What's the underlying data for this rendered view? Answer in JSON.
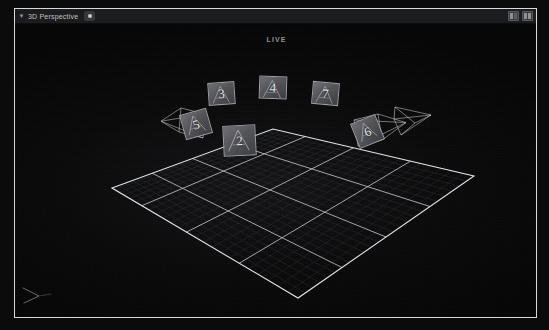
{
  "window": {
    "title": "3D Perspective",
    "caret_icon": "chevron-down-icon",
    "camera_badge_icon": "camera-icon",
    "toolbar_icons": [
      "panel-layout-icon",
      "split-layout-icon"
    ]
  },
  "scene": {
    "live_label": "LIVE",
    "axis_gizmo_icon": "axis-gizmo-icon",
    "background_color": "#0a0a0b",
    "grid_line_color": "#cfd2d6",
    "grid_subline_color": "#3a3d42",
    "frustum_line_color": "#c8cace",
    "plane_fill_color": "#55565a",
    "plane_border_color": "#9d9ea2",
    "grid": {
      "major_divisions": 4,
      "minor_divisions": 24,
      "corners_px": [
        [
          97,
          164
        ],
        [
          258,
          105
        ],
        [
          459,
          152
        ],
        [
          283,
          274
        ]
      ]
    },
    "cameras": [
      {
        "id": "cam-5",
        "label": "5",
        "x": 150,
        "y": 78,
        "w": 46,
        "h": 40,
        "plane_w": 28,
        "plane_h": 26,
        "plane_x": 17,
        "plane_y": 9,
        "rotate": -16,
        "wireframe": true,
        "apex": "left"
      },
      {
        "id": "cam-3",
        "label": "3",
        "x": 190,
        "y": 55,
        "w": 34,
        "h": 30,
        "plane_w": 27,
        "plane_h": 23,
        "plane_x": 3,
        "plane_y": 3,
        "rotate": -4,
        "wireframe": false,
        "apex": "none"
      },
      {
        "id": "cam-4",
        "label": "4",
        "x": 241,
        "y": 49,
        "w": 34,
        "h": 30,
        "plane_w": 28,
        "plane_h": 23,
        "plane_x": 3,
        "plane_y": 3,
        "rotate": 2,
        "wireframe": false,
        "apex": "none"
      },
      {
        "id": "cam-7",
        "label": "7",
        "x": 294,
        "y": 55,
        "w": 34,
        "h": 30,
        "plane_w": 27,
        "plane_h": 23,
        "plane_x": 3,
        "plane_y": 3,
        "rotate": 5,
        "wireframe": false,
        "apex": "none"
      },
      {
        "id": "cam-6",
        "label": "6",
        "x": 337,
        "y": 86,
        "w": 50,
        "h": 42,
        "plane_w": 27,
        "plane_h": 27,
        "plane_x": 2,
        "plane_y": 8,
        "rotate": -22,
        "wireframe": true,
        "apex": "right"
      },
      {
        "id": "cam-2",
        "label": "2",
        "x": 205,
        "y": 98,
        "w": 40,
        "h": 38,
        "plane_w": 33,
        "plane_h": 31,
        "plane_x": 3,
        "plane_y": 3,
        "rotate": -3,
        "wireframe": false,
        "apex": "none"
      },
      {
        "id": "cam-8",
        "label": "",
        "x": 378,
        "y": 79,
        "w": 40,
        "h": 38,
        "plane_w": 0,
        "plane_h": 0,
        "plane_x": 0,
        "plane_y": 0,
        "rotate": 0,
        "wireframe": true,
        "apex": "only"
      }
    ]
  }
}
